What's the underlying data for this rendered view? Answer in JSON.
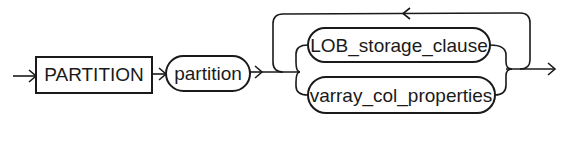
{
  "diagram": {
    "type": "railroad-syntax-diagram",
    "nodes": {
      "keyword_partition": {
        "label": "PARTITION",
        "kind": "keyword-box"
      },
      "var_partition": {
        "label": "partition",
        "kind": "nonterminal-oval"
      },
      "choice_1": {
        "label": "LOB_storage_clause",
        "kind": "nonterminal-oval"
      },
      "choice_2": {
        "label": "varray_col_properties",
        "kind": "nonterminal-oval"
      }
    },
    "structure": [
      "PARTITION",
      "partition",
      "repeat(choice(LOB_storage_clause | varray_col_properties))"
    ],
    "colors": {
      "stroke": "#1a1a1a",
      "background": "#ffffff"
    }
  }
}
